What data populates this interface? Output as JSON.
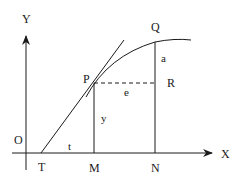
{
  "diagram": {
    "type": "geometry-figure",
    "axes": {
      "x_label": "X",
      "y_label": "Y",
      "origin_label": "O"
    },
    "points": {
      "P": "P",
      "Q": "Q",
      "R": "R",
      "T": "T",
      "M": "M",
      "N": "N"
    },
    "segments": {
      "a": "a",
      "e": "e",
      "y": "y",
      "t": "t"
    },
    "colors": {
      "stroke": "#1a1a1a",
      "background": "#ffffff"
    }
  }
}
